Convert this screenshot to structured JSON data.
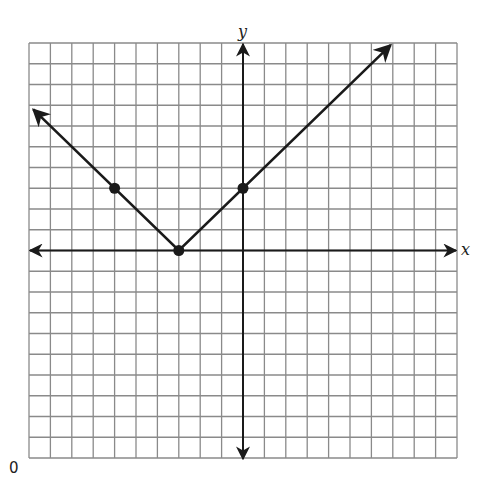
{
  "chart_data": {
    "type": "line",
    "title": "",
    "xlabel": "x",
    "ylabel": "y",
    "xlim": [
      -10,
      10
    ],
    "ylim": [
      -10,
      10
    ],
    "grid": true,
    "grid_step": 1,
    "legend": null,
    "series": [
      {
        "name": "y = |x + 3|",
        "style": "solid with arrowheads at both ends",
        "x": [
          -9.8,
          -3,
          6.9
        ],
        "y": [
          6.8,
          0,
          9.9
        ]
      }
    ],
    "marked_points": [
      {
        "x": -6,
        "y": 3
      },
      {
        "x": -3,
        "y": 0
      },
      {
        "x": 0,
        "y": 3
      }
    ],
    "annotations": [
      "0"
    ]
  },
  "labels": {
    "x_axis": "x",
    "y_axis": "y",
    "corner": "0"
  },
  "colors": {
    "grid": "#8a8a8a",
    "axis": "#1a1a1a",
    "line": "#1a1a1a",
    "background": "#ffffff"
  }
}
